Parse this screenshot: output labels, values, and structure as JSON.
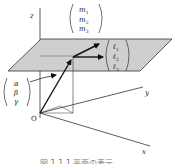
{
  "diagram": {
    "axes": {
      "x_label": "x",
      "y_label": "y",
      "z_label": "z",
      "origin_label": "O"
    },
    "vectors": {
      "m": [
        "m",
        "m",
        "m"
      ],
      "m_sub": [
        "1",
        "2",
        "3"
      ],
      "l": [
        "ℓ",
        "ℓ",
        "ℓ"
      ],
      "l_sub": [
        "1",
        "2",
        "3"
      ],
      "point": [
        "α",
        "β",
        "γ"
      ]
    },
    "caption": "図 1.1.1 平面の表示",
    "colors": {
      "plane_fill": "#cfcfcf",
      "line": "#222222"
    }
  }
}
